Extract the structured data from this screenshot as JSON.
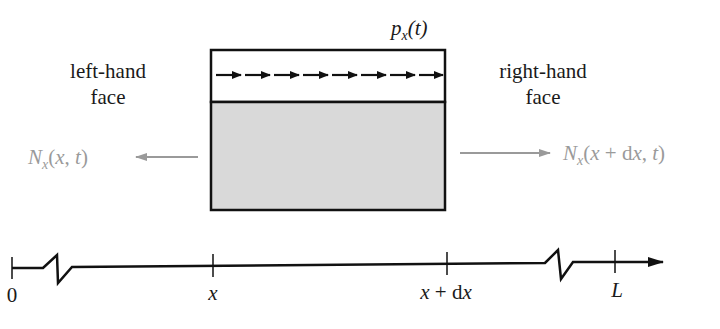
{
  "load": {
    "label_main": "p",
    "label_sub": "x",
    "label_arg": "(t)",
    "arrow_count": 8
  },
  "faces": {
    "left": {
      "line1": "left-hand",
      "line2": "face"
    },
    "right": {
      "line1": "right-hand",
      "line2": "face"
    }
  },
  "forces": {
    "left": {
      "main": "N",
      "sub": "x",
      "open": "(",
      "arg1": "x",
      "sep": ", ",
      "arg2": "t",
      "close": ")"
    },
    "right": {
      "main": "N",
      "sub": "x",
      "open": "(",
      "arg1": "x",
      "plus": " + ",
      "d": "d",
      "arg1b": "x",
      "sep": ", ",
      "arg2": "t",
      "close": ")"
    }
  },
  "axis": {
    "ticks": [
      {
        "label": "0",
        "x": 12
      },
      {
        "label": "x",
        "x": 213
      },
      {
        "label": "x + dx",
        "label_x": "x",
        "label_plus": " + ",
        "label_d": "d",
        "label_x2": "x",
        "x": 447
      },
      {
        "label": "L",
        "x": 615
      }
    ]
  },
  "colors": {
    "stroke": "#111111",
    "fill_body": "#d9d9d9",
    "force_grey": "#9a9a9a"
  }
}
